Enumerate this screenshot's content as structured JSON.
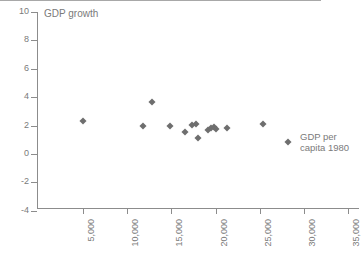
{
  "chart_data": {
    "type": "scatter",
    "title": "",
    "ylabel": "GDP growth",
    "xlabel": "GDP per capita 1980",
    "xlabel_lines": [
      "GDP per",
      "capita 1980"
    ],
    "xlim": [
      0,
      37000
    ],
    "ylim": [
      -4,
      10
    ],
    "grid": false,
    "legend": null,
    "marker": "diamond",
    "marker_color": "#6e6e6e",
    "axis_color": "#8c8c8c",
    "zero_line_color": "#a8a8a8",
    "x_ticks": [
      {
        "value": 5000,
        "label": "5,000"
      },
      {
        "value": 10000,
        "label": "10,000"
      },
      {
        "value": 15000,
        "label": "15,000"
      },
      {
        "value": 20000,
        "label": "20,000"
      },
      {
        "value": 25000,
        "label": "25,000"
      },
      {
        "value": 30000,
        "label": "30,000"
      },
      {
        "value": 35000,
        "label": "35,000"
      }
    ],
    "y_ticks": [
      {
        "value": 10,
        "label": "10"
      },
      {
        "value": 8,
        "label": "8"
      },
      {
        "value": 6,
        "label": "6"
      },
      {
        "value": 4,
        "label": "4"
      },
      {
        "value": 2,
        "label": "2"
      },
      {
        "value": 0,
        "label": "0"
      },
      {
        "value": -2,
        "label": "-2"
      },
      {
        "value": -4,
        "label": "-4"
      }
    ],
    "points": [
      {
        "x": 5000,
        "y": 2.35
      },
      {
        "x": 11800,
        "y": 2.0
      },
      {
        "x": 12800,
        "y": 3.65
      },
      {
        "x": 14800,
        "y": 2.0
      },
      {
        "x": 16600,
        "y": 1.55
      },
      {
        "x": 17300,
        "y": 2.05
      },
      {
        "x": 17800,
        "y": 2.1
      },
      {
        "x": 18000,
        "y": 1.15
      },
      {
        "x": 19100,
        "y": 1.7
      },
      {
        "x": 19500,
        "y": 1.8
      },
      {
        "x": 19800,
        "y": 1.9
      },
      {
        "x": 20100,
        "y": 1.75
      },
      {
        "x": 21300,
        "y": 1.8
      },
      {
        "x": 25400,
        "y": 2.1
      },
      {
        "x": 28200,
        "y": 0.85
      }
    ]
  }
}
